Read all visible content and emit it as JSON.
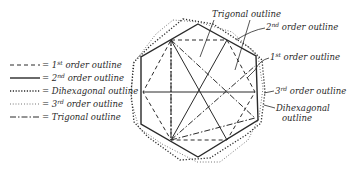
{
  "legend": {
    "items": [
      {
        "key": "first-order",
        "style": "dashed",
        "label_prefix": "= 1",
        "label_sup": "st",
        "label_suffix": " order outline"
      },
      {
        "key": "second-order",
        "style": "solid",
        "label_prefix": "= 2",
        "label_sup": "nd",
        "label_suffix": " order outline"
      },
      {
        "key": "dihexagonal",
        "style": "heavy-dotted",
        "label_prefix": "= Dihexagonal outline",
        "label_sup": "",
        "label_suffix": ""
      },
      {
        "key": "third-order",
        "style": "fine-dotted",
        "label_prefix": "= 3",
        "label_sup": "rd",
        "label_suffix": " order outline"
      },
      {
        "key": "trigonal",
        "style": "dash-dot",
        "label_prefix": "= Trigonal outline",
        "label_sup": "",
        "label_suffix": ""
      }
    ]
  },
  "callouts": {
    "trigonal": "Trigonal outline",
    "second_order_num": "2",
    "second_order_sup": "nd",
    "second_order_rest": " order outline",
    "first_order_num": "1",
    "first_order_sup": "st",
    "first_order_rest": " order outline",
    "third_order_num": "3",
    "third_order_sup": "rd",
    "third_order_rest": " order outline",
    "dihexagonal_line1": "Dihexagonal",
    "dihexagonal_line2": "outline"
  },
  "colors": {
    "ink": "#2a2a2a",
    "paper": "#ffffff"
  }
}
